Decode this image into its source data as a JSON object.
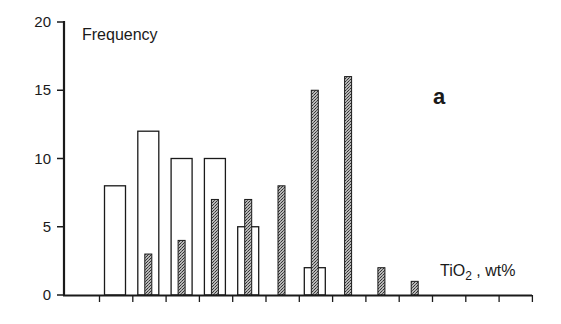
{
  "chart_data": {
    "type": "bar",
    "title": "",
    "panel_label": "a",
    "xlabel": "TiO2 , wt%",
    "xlabel_main": "TiO",
    "xlabel_sub": "2",
    "xlabel_rest": " , wt%",
    "ylabel": "Frequency",
    "ylim": [
      0,
      20
    ],
    "yticks": [
      0,
      5,
      10,
      15,
      20
    ],
    "x_tick_count": 14,
    "x_tick_labels": [],
    "grid": false,
    "legend": null,
    "categories": [
      "bin1",
      "bin2",
      "bin3",
      "bin4",
      "bin5",
      "bin6",
      "bin7",
      "bin8",
      "bin9",
      "bin10",
      "bin11",
      "bin12",
      "bin13"
    ],
    "series": [
      {
        "name": "open bars",
        "fill": "#ffffff",
        "stroke": "#1a1a1a",
        "values": [
          8,
          12,
          10,
          10,
          5,
          0,
          2,
          0,
          0,
          0,
          0,
          0,
          0
        ]
      },
      {
        "name": "shaded bars",
        "fill": "#8a8a8a",
        "stroke": "#1a1a1a",
        "values": [
          0,
          3,
          4,
          7,
          7,
          8,
          15,
          16,
          2,
          1,
          0,
          0,
          0
        ]
      }
    ]
  }
}
